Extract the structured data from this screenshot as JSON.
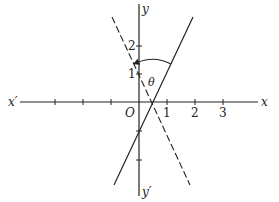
{
  "diagram": {
    "axis_labels": {
      "x_pos": "x",
      "x_neg": "x′",
      "y_pos": "y",
      "y_neg": "y′",
      "origin": "O"
    },
    "x_ticks": [
      "1",
      "2",
      "3"
    ],
    "y_ticks": [
      "1",
      "2"
    ],
    "angle_label": "θ",
    "lines": [
      {
        "name": "solid-line",
        "equation": "y = 2x - 1",
        "style": "solid"
      },
      {
        "name": "dashed-line",
        "equation": "y = -2x + 1",
        "style": "dashed"
      }
    ],
    "colors": {
      "ink": "#222222",
      "background": "#ffffff"
    }
  }
}
